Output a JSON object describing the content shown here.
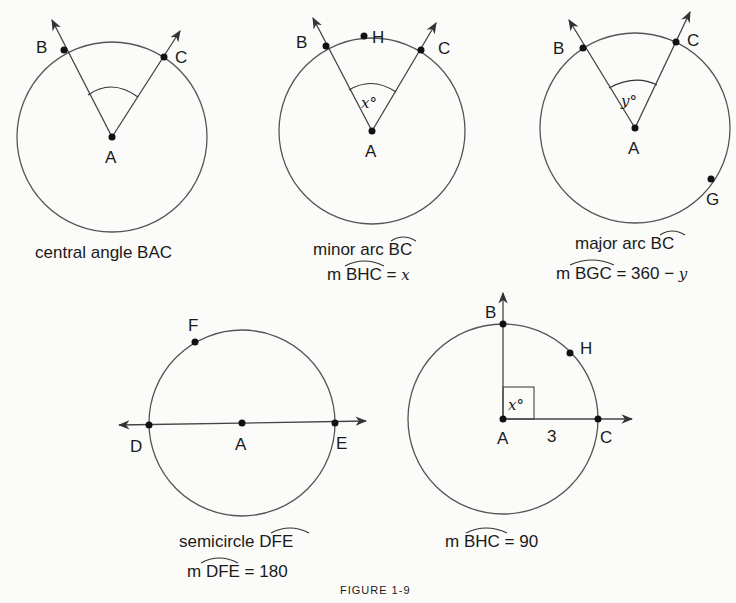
{
  "figure_title": "FIGURE 1-9",
  "panels": [
    {
      "id": "central-angle",
      "points": {
        "center": "A",
        "p1": "B",
        "p2": "C"
      },
      "angle_label": "",
      "caption_line1": "central angle BAC"
    },
    {
      "id": "minor-arc",
      "points": {
        "center": "A",
        "p1": "B",
        "p2": "C",
        "arc_point": "H"
      },
      "angle_label": "x°",
      "caption_line1_prefix": "minor arc ",
      "caption_line1_arc": "BC",
      "caption_line2_prefix": "m ",
      "caption_line2_arc": "BHC",
      "caption_line2_suffix": " = ",
      "caption_line2_value": "x"
    },
    {
      "id": "major-arc",
      "points": {
        "center": "A",
        "p1": "B",
        "p2": "C",
        "arc_point": "G"
      },
      "angle_label": "y°",
      "caption_line1_prefix": "major arc ",
      "caption_line1_arc": "BC",
      "caption_line2_prefix": "m ",
      "caption_line2_arc": "BGC",
      "caption_line2_suffix": " = 360 − ",
      "caption_line2_value": "y"
    },
    {
      "id": "semicircle",
      "points": {
        "center": "A",
        "p1": "D",
        "p2": "E",
        "arc_point": "F"
      },
      "caption_line1_prefix": "semicircle ",
      "caption_line1_arc": "DFE",
      "caption_line2_prefix": "m ",
      "caption_line2_arc": "DFE",
      "caption_line2_suffix": " = 180"
    },
    {
      "id": "quarter-arc",
      "points": {
        "center": "A",
        "p1": "B",
        "p2": "C",
        "arc_point": "H"
      },
      "angle_label": "x°",
      "radius_label": "3",
      "caption_line1_prefix": "m ",
      "caption_line1_arc": "BHC",
      "caption_line1_suffix": " = 90"
    }
  ]
}
